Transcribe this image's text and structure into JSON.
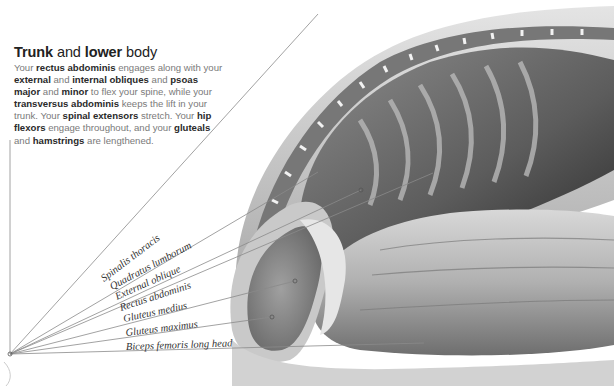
{
  "heading": {
    "bold1": "Trunk",
    "plain1": " and ",
    "bold2": "lower",
    "plain2": " body"
  },
  "paragraph": [
    {
      "t": "Your ",
      "b": false
    },
    {
      "t": "rectus abdominis",
      "b": true
    },
    {
      "t": " engages along with your ",
      "b": false
    },
    {
      "t": "external",
      "b": true
    },
    {
      "t": " and ",
      "b": false
    },
    {
      "t": "internal obliques",
      "b": true
    },
    {
      "t": " and ",
      "b": false
    },
    {
      "t": "psoas major",
      "b": true
    },
    {
      "t": " and ",
      "b": false
    },
    {
      "t": "minor",
      "b": true
    },
    {
      "t": " to flex your spine, while your ",
      "b": false
    },
    {
      "t": "transversus abdominis",
      "b": true
    },
    {
      "t": " keeps the lift in your trunk. Your ",
      "b": false
    },
    {
      "t": "spinal extensors",
      "b": true
    },
    {
      "t": " stretch. Your ",
      "b": false
    },
    {
      "t": "hip flexors",
      "b": true
    },
    {
      "t": " engage throughout, and your ",
      "b": false
    },
    {
      "t": "gluteals",
      "b": true
    },
    {
      "t": " and ",
      "b": false
    },
    {
      "t": "hamstrings",
      "b": true
    },
    {
      "t": " are lengthened.",
      "b": false
    }
  ],
  "labels": [
    {
      "text": "Spinalis thoracis",
      "x2": 318,
      "y2": 14
    },
    {
      "text": "Quadratus lumborum",
      "x2": 318,
      "y2": 172
    },
    {
      "text": "External oblique",
      "x2": 361,
      "y2": 190
    },
    {
      "text": "Rectus abdominis",
      "x2": 433,
      "y2": 173
    },
    {
      "text": "Gluteus medius",
      "x2": 295,
      "y2": 281
    },
    {
      "text": "Gluteus maximus",
      "x2": 272,
      "y2": 317
    },
    {
      "text": "Biceps femoris long head",
      "x2": 424,
      "y2": 343
    }
  ],
  "colors": {
    "line": "#8a8a8a",
    "muscle_dark": "#5a5a5a",
    "muscle_mid": "#9a9a9a",
    "muscle_light": "#d6d6d6"
  }
}
